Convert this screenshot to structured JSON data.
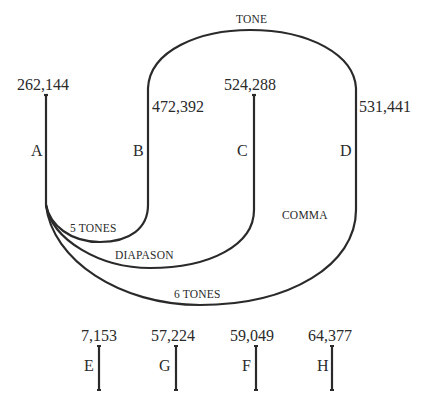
{
  "diagram": {
    "stroke_color": "#2a2a2a",
    "arc_labels": {
      "tone": "TONE",
      "five_tones": "5 TONES",
      "diapason": "DIAPASON",
      "six_tones": "6 TONES",
      "comma": "COMMA"
    },
    "strings": [
      {
        "letter": "A",
        "value": "262,144"
      },
      {
        "letter": "B",
        "value": "472,392"
      },
      {
        "letter": "C",
        "value": "524,288"
      },
      {
        "letter": "D",
        "value": "531,441"
      }
    ],
    "small_strings": [
      {
        "letter": "E",
        "value": "7,153"
      },
      {
        "letter": "G",
        "value": "57,224"
      },
      {
        "letter": "F",
        "value": "59,049"
      },
      {
        "letter": "H",
        "value": "64,377"
      }
    ]
  }
}
